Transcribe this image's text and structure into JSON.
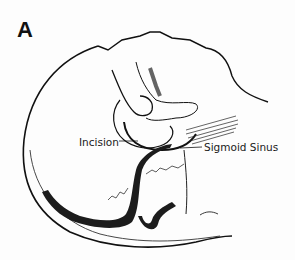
{
  "figure": {
    "panel_label": "A",
    "labels": {
      "incision": "Incision",
      "sigmoid_sinus": "Sigmoid Sinus"
    },
    "colors": {
      "line": "#111111",
      "background": "#fdfdfd",
      "sinus_fill": "#1c1c1c"
    }
  }
}
